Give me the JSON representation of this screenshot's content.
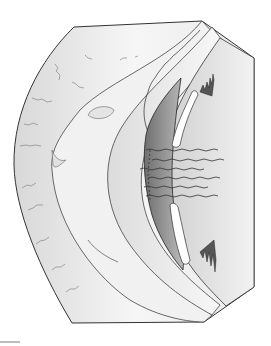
{
  "figure": {
    "colors": {
      "outline": "#333333",
      "fill_light": "#f4f4f4",
      "fill_mid": "#d9d9d9",
      "fill_dark": "#8a8a8a",
      "background": "#ffffff"
    }
  }
}
